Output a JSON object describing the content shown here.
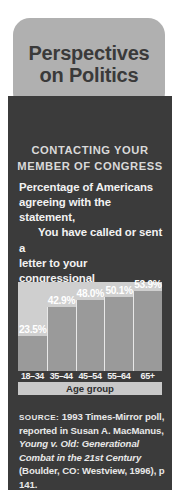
{
  "title": {
    "line1": "Perspectives",
    "line2": "on Politics"
  },
  "heading": {
    "line1": "CONTACTING YOUR",
    "line2": "MEMBER OF CONGRESS"
  },
  "statement": {
    "intro_line1": "Percentage of Americans",
    "intro_line2": "agreeing with the",
    "intro_line3": "statement,",
    "quote_line1": "You have called or sent a",
    "quote_line2": "letter to your congressional",
    "quote_line3": "representative."
  },
  "chart_data": {
    "type": "bar",
    "title": "Percentage of Americans agreeing with the statement, You have called or sent a letter to your congressional representative.",
    "categories": [
      "18–34",
      "35–44",
      "45–54",
      "55–64",
      "65+"
    ],
    "values": [
      23.5,
      42.9,
      48.0,
      50.1,
      53.9
    ],
    "value_labels": [
      "23.5%",
      "42.9%",
      "48.0%",
      "50.1%",
      "53.9%"
    ],
    "xlabel": "Age group",
    "ylabel": "",
    "ylim": [
      0,
      60
    ],
    "grid": false,
    "legend": "none",
    "bar_color": "#9a9a9a",
    "plot_background": "#cfcfcf"
  },
  "source": {
    "label": "SOURCE:",
    "text_1": " 1993 Times-Mirror poll, reported in Susan A. MacManus, ",
    "italic_1": "Young v. Old: Generational Combat in the 21st Century",
    "text_2": " (Boulder, CO: Westview, 1996), p 141."
  },
  "colors": {
    "panel": "#3b3b3b",
    "bubble": "#b0b0b0",
    "title_text": "#3a3a3a",
    "accent_light": "#cfcfcf"
  }
}
